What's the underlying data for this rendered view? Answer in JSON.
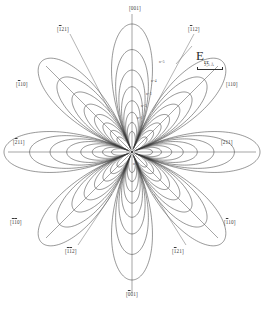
{
  "figure": {
    "title_symbol": "E",
    "title_subscript": "rr",
    "scale_value": "2,5 Å",
    "background": "#ffffff",
    "line_color": "#3a3a3a",
    "axis_color": "#555555"
  },
  "direction_labels": [
    {
      "id": "top",
      "text": "[001]",
      "overline": "",
      "x": 129,
      "y": 6
    },
    {
      "id": "bottom",
      "text": "[001]",
      "overline": "1",
      "x": 126,
      "y": 292
    },
    {
      "id": "left",
      "text": "[211]",
      "overline": "2",
      "x": 13,
      "y": 140
    },
    {
      "id": "right",
      "text": "[211]",
      "overline": "",
      "x": 221,
      "y": 140
    },
    {
      "id": "upper-left",
      "text": "[121]",
      "overline": "1",
      "x": 57,
      "y": 27
    },
    {
      "id": "upper-right",
      "text": "[112]",
      "overline": "1",
      "x": 188,
      "y": 27
    },
    {
      "id": "lower-left",
      "text": "[112]",
      "overline": "11",
      "x": 65,
      "y": 249
    },
    {
      "id": "lower-right",
      "text": "[121]",
      "overline": "1",
      "x": 172,
      "y": 249
    },
    {
      "id": "mid-left",
      "text": "[110]",
      "overline": "1",
      "x": 16,
      "y": 82
    },
    {
      "id": "mid-right",
      "text": "[110]",
      "overline": "",
      "x": 226,
      "y": 82
    },
    {
      "id": "mid-lower-left",
      "text": "[110]",
      "overline": "11",
      "x": 10,
      "y": 220
    },
    {
      "id": "mid-lower-right",
      "text": "[110]",
      "overline": "1",
      "x": 224,
      "y": 220
    }
  ],
  "contour_ticks": [
    {
      "label": "n=5",
      "x": 159,
      "y": 60
    },
    {
      "label": "n=4",
      "x": 151,
      "y": 79
    },
    {
      "label": "n=3",
      "x": 146,
      "y": 92
    },
    {
      "label": "n=2",
      "x": 141,
      "y": 104
    },
    {
      "label": "n=1",
      "x": 137,
      "y": 116
    },
    {
      "label": "n=0",
      "x": 133,
      "y": 162
    }
  ],
  "contours": {
    "count": 8,
    "petal_lobes": 8,
    "max_radius_px": 128,
    "scale_factors": [
      1.0,
      0.8,
      0.64,
      0.51,
      0.4,
      0.31,
      0.23,
      0.16
    ]
  }
}
